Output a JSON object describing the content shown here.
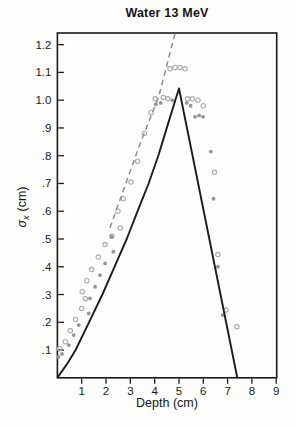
{
  "title": "Water 13 MeV",
  "chart_data": {
    "type": "scatter",
    "title": "Water 13 MeV",
    "xlabel": "Depth (cm)",
    "ylabel": "σx (cm)",
    "ylabel_symbol": "σ",
    "ylabel_subscript": "x",
    "ylabel_unit": "(cm)",
    "xlim": [
      0,
      9.02
    ],
    "ylim": [
      0,
      1.242
    ],
    "grid": false,
    "legend": "none",
    "x_ticks": [
      1,
      2,
      3,
      4,
      5,
      6,
      7,
      8,
      9
    ],
    "y_ticks": [
      {
        "v": 0.1,
        "label": ".1"
      },
      {
        "v": 0.2,
        "label": ".2"
      },
      {
        "v": 0.3,
        "label": ".3"
      },
      {
        "v": 0.4,
        "label": ".4"
      },
      {
        "v": 0.5,
        "label": ".5"
      },
      {
        "v": 0.6,
        "label": ".6"
      },
      {
        "v": 0.7,
        "label": ".7"
      },
      {
        "v": 0.8,
        "label": ".8"
      },
      {
        "v": 0.9,
        "label": ".9"
      },
      {
        "v": 1.0,
        "label": "1.0"
      },
      {
        "v": 1.1,
        "label": "1.1"
      },
      {
        "v": 1.2,
        "label": "1.2"
      }
    ],
    "colors": {
      "axis": "#1a1a1a",
      "solid_curve": "#1c1c1c",
      "dashed_line": "#8e8e8e",
      "open_points": "#aaaaaa",
      "filled_points": "#949494",
      "background": "#fdfdfc"
    },
    "series": [
      {
        "name": "measured-open-circles",
        "marker": "open-circle",
        "points": [
          [
            0.09,
            0.105
          ],
          [
            0.33,
            0.13
          ],
          [
            0.53,
            0.17
          ],
          [
            0.75,
            0.21
          ],
          [
            1.0,
            0.25
          ],
          [
            1.15,
            0.285
          ],
          [
            1.02,
            0.31
          ],
          [
            1.21,
            0.35
          ],
          [
            1.41,
            0.39
          ],
          [
            1.68,
            0.435
          ],
          [
            1.96,
            0.48
          ],
          [
            2.24,
            0.51
          ],
          [
            2.58,
            0.54
          ],
          [
            2.49,
            0.6
          ],
          [
            2.71,
            0.645
          ],
          [
            3.03,
            0.705
          ],
          [
            3.3,
            0.78
          ],
          [
            3.58,
            0.88
          ],
          [
            3.85,
            0.955
          ],
          [
            4.02,
            1.005
          ],
          [
            4.36,
            1.01
          ],
          [
            4.54,
            1.005
          ],
          [
            4.63,
            1.113
          ],
          [
            4.84,
            1.118
          ],
          [
            5.04,
            1.118
          ],
          [
            5.25,
            1.113
          ],
          [
            5.36,
            1.005
          ],
          [
            5.55,
            1.005
          ],
          [
            5.78,
            1.0
          ],
          [
            6.0,
            0.98
          ],
          [
            6.46,
            0.74
          ],
          [
            6.6,
            0.444
          ],
          [
            6.93,
            0.244
          ],
          [
            7.38,
            0.184
          ]
        ]
      },
      {
        "name": "measured-filled-circles",
        "marker": "filled-circle",
        "points": [
          [
            0.05,
            0.075
          ],
          [
            0.19,
            0.086
          ],
          [
            0.47,
            0.118
          ],
          [
            0.67,
            0.154
          ],
          [
            0.88,
            0.19
          ],
          [
            1.29,
            0.232
          ],
          [
            1.34,
            0.286
          ],
          [
            1.55,
            0.328
          ],
          [
            1.75,
            0.37
          ],
          [
            1.96,
            0.412
          ],
          [
            2.3,
            0.454
          ],
          [
            2.23,
            0.508
          ],
          [
            4.05,
            0.985
          ],
          [
            4.25,
            0.99
          ],
          [
            4.73,
            1.0
          ],
          [
            5.32,
            0.99
          ],
          [
            5.48,
            0.98
          ],
          [
            5.66,
            0.94
          ],
          [
            5.83,
            0.945
          ],
          [
            5.99,
            0.94
          ],
          [
            6.31,
            0.815
          ],
          [
            6.42,
            0.645
          ],
          [
            6.6,
            0.4
          ],
          [
            6.8,
            0.226
          ]
        ]
      },
      {
        "name": "model-solid-curve",
        "style": "solid",
        "points": [
          [
            0,
            0
          ],
          [
            0.4,
            0.05
          ],
          [
            0.75,
            0.1
          ],
          [
            1.3,
            0.2
          ],
          [
            1.85,
            0.3
          ],
          [
            2.35,
            0.4
          ],
          [
            2.85,
            0.5
          ],
          [
            3.3,
            0.6
          ],
          [
            3.75,
            0.7
          ],
          [
            4.15,
            0.8
          ],
          [
            4.5,
            0.9
          ],
          [
            4.85,
            1.0
          ],
          [
            5.0,
            1.042
          ],
          [
            7.4,
            0
          ]
        ]
      },
      {
        "name": "model-dashed-line",
        "style": "dashed",
        "points": [
          [
            2.16,
            0.54
          ],
          [
            3.43,
            0.85
          ],
          [
            4.16,
            1.01
          ],
          [
            4.84,
            1.241
          ]
        ]
      }
    ]
  }
}
